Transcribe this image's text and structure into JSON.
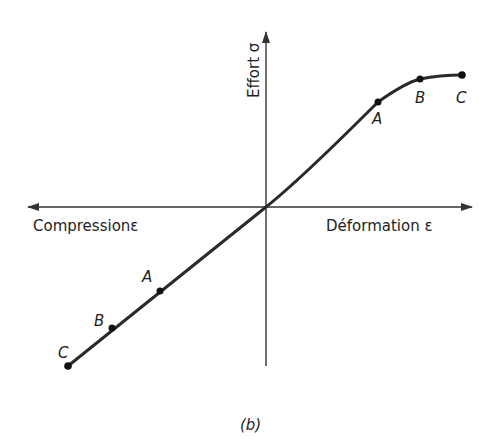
{
  "diagram": {
    "y_axis_label": "Effort σ",
    "x_axis_pos_label": "Déformation ε",
    "x_axis_neg_label": "Compressionε",
    "caption": "(b)",
    "colors": {
      "line": "#2a2a2a",
      "axis": "#333333",
      "background": "#ffffff"
    },
    "points_upper": [
      {
        "label": "A"
      },
      {
        "label": "B"
      },
      {
        "label": "C"
      }
    ],
    "points_lower": [
      {
        "label": "A"
      },
      {
        "label": "B"
      },
      {
        "label": "C"
      }
    ]
  }
}
